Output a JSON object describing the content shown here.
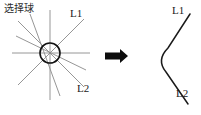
{
  "figure": {
    "title_note": "fillet-operation-diagram",
    "background_color": "#ffffff",
    "width": 201,
    "height": 115
  },
  "left_panel": {
    "caption": "选择球",
    "caption_meaning": "selection ball",
    "line_labels": {
      "upper": "L1",
      "lower": "L2"
    },
    "selection_circle": {
      "center_x": 50,
      "center_y": 53,
      "radius": 10,
      "stroke_color": "#111111"
    },
    "ray_color": "#8a8a8a",
    "rays": [
      {
        "name": "horizontal",
        "x1": 12,
        "y1": 53,
        "x2": 90,
        "y2": 53
      },
      {
        "name": "vertical",
        "x1": 50,
        "y1": 10,
        "x2": 50,
        "y2": 100
      },
      {
        "name": "diagonal-l1",
        "x1": 18,
        "y1": 85,
        "x2": 84,
        "y2": 19
      },
      {
        "name": "diagonal-l2",
        "x1": 18,
        "y1": 21,
        "x2": 84,
        "y2": 87
      },
      {
        "name": "steep-left-upper",
        "x1": 30,
        "y1": 14,
        "x2": 60,
        "y2": 96
      },
      {
        "name": "shallow-left",
        "x1": 16,
        "y1": 36,
        "x2": 86,
        "y2": 70
      }
    ]
  },
  "arrow": {
    "name": "transform-arrow",
    "color": "#0d0d0d",
    "x": 105,
    "y": 56,
    "length": 22
  },
  "right_panel": {
    "line_labels": {
      "upper": "L1",
      "lower": "L2"
    },
    "curve_color": "#1a1a1a",
    "curve_path": "M 190 14 L 168 48 Q 156 60 166 72 L 188 104",
    "description": "filleted corner between L1 and L2"
  }
}
